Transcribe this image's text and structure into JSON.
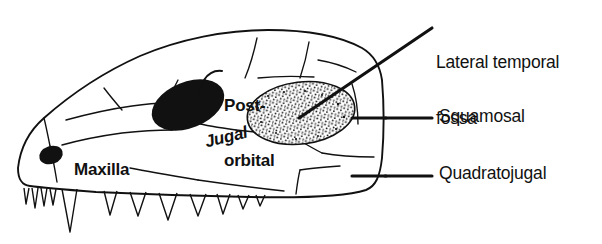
{
  "figure": {
    "type": "anatomical-line-drawing",
    "view": "left lateral",
    "background_color": "#ffffff",
    "ink_color": "#111111"
  },
  "labels": {
    "lateral_temporal_fossa": "Lateral temporal\nfossa",
    "lateral_temporal_fossa_line1": "Lateral temporal",
    "lateral_temporal_fossa_line2": "fossa",
    "squamosal": "Squamosal",
    "quadratojugal": "Quadratojugal",
    "postorbital": "Post-\norbital",
    "postorbital_line1": "Post-",
    "postorbital_line2": "orbital",
    "maxilla": "Maxilla",
    "jugal": "Jugal"
  },
  "features": {
    "orbit": "solid-black-ellipse",
    "naris": "solid-black-ellipse",
    "fossa_fill": "stippled",
    "teeth_count": 12,
    "sutures": "wavy-lines"
  },
  "leaders": {
    "fossa_leader": "diagonal",
    "squamosal_leader": "horizontal-with-tick",
    "quadratojugal_leader": "horizontal-with-tick",
    "postorbital_leader": "short-tick"
  }
}
